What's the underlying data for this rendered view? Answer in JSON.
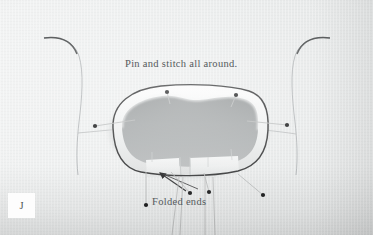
{
  "figure": {
    "step_label": "J",
    "medium": "photograph"
  },
  "annotations": {
    "caption_top": "Pin and stitch all around.",
    "caption_folded": "Folded ends"
  },
  "colors": {
    "fabric_light": "#f2f3f3",
    "fabric_mid": "#e8eaea",
    "fabric_shadow": "#d9dbdb",
    "opening_void": "#9fa3a4",
    "stitch_line": "#2e2f30",
    "pin_head": "#161718",
    "pin_shaft": "#b9bbbb",
    "text": "#55595c",
    "chip_background": "#fdfdfd"
  },
  "pins": [
    {
      "name": "pin-top-left",
      "head_x": 167,
      "head_y": 92,
      "tip_x": 170,
      "tip_y": 104
    },
    {
      "name": "pin-top-right",
      "head_x": 236,
      "head_y": 95,
      "tip_x": 231,
      "tip_y": 107
    },
    {
      "name": "pin-left-side",
      "head_x": 95,
      "head_y": 126,
      "tip_x": 135,
      "tip_y": 120
    },
    {
      "name": "pin-right-side",
      "head_x": 287,
      "head_y": 125,
      "tip_x": 247,
      "tip_y": 121
    },
    {
      "name": "pin-bottom-far-left",
      "head_x": 146,
      "head_y": 205,
      "tip_x": 146,
      "tip_y": 172
    },
    {
      "name": "pin-bottom-left",
      "head_x": 190,
      "head_y": 193,
      "tip_x": 171,
      "tip_y": 172
    },
    {
      "name": "pin-bottom-center",
      "head_x": 209,
      "head_y": 192,
      "tip_x": 204,
      "tip_y": 173
    },
    {
      "name": "pin-bottom-right",
      "head_x": 263,
      "head_y": 195,
      "tip_x": 238,
      "tip_y": 174
    }
  ],
  "leader_lines": [
    {
      "name": "leader-folded-ends-left",
      "from_x": 186,
      "from_y": 191,
      "to_x": 160,
      "to_y": 173,
      "arrow": true
    },
    {
      "name": "leader-folded-ends-right",
      "from_x": 198,
      "from_y": 189,
      "to_x": 163,
      "to_y": 174,
      "arrow": false
    }
  ]
}
